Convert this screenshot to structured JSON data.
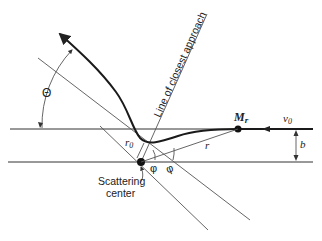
{
  "figure": {
    "type": "scattering-geometry",
    "labels": {
      "line_of_closest_approach": "Line of closest approach",
      "scattering_center": "Scattering",
      "scattering_center_2": "center",
      "theta": "Θ",
      "mass": "M",
      "mass_sub": "r",
      "velocity": "v",
      "velocity_sub": "0",
      "impact_param": "b",
      "r_min": "r",
      "r_min_sub": "0",
      "r": "r",
      "phi": "φ",
      "phi2": "φ"
    },
    "colors": {
      "trajectory": "#1a1a1a",
      "construction_lines": "#555555",
      "background": "#ffffff"
    }
  }
}
